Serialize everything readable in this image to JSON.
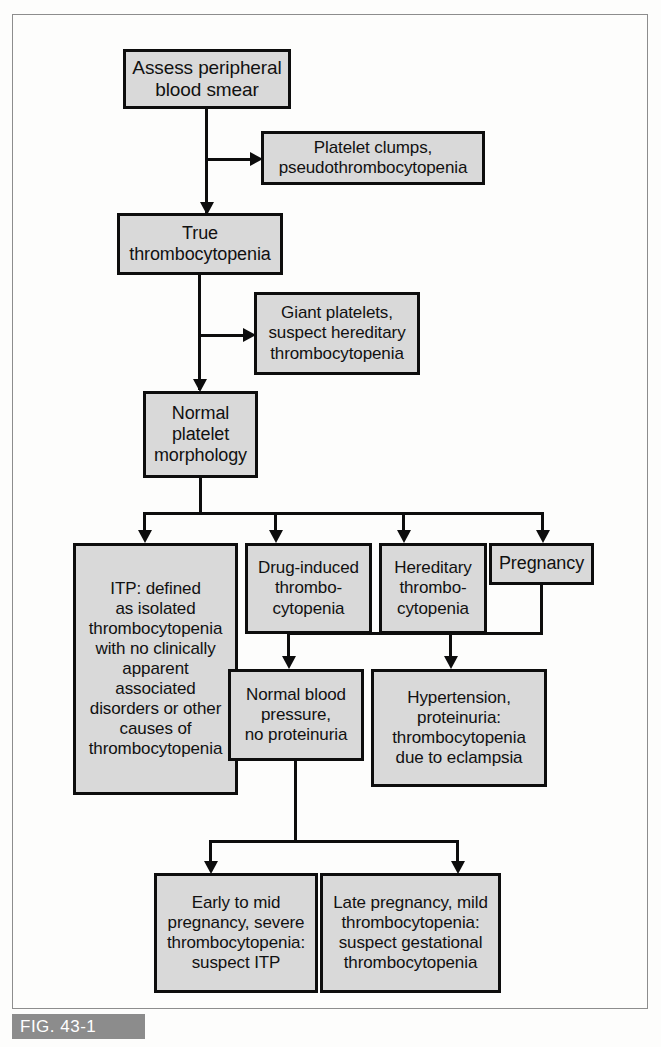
{
  "figure": {
    "caption": "FIG. 43-1",
    "colors": {
      "node_fill": "#d9d9d9",
      "node_border": "#0d0d0d",
      "caption_bar": "#8c8c8c",
      "caption_text": "#ffffff",
      "frame_border": "#8d8d8d",
      "page_background": "#fdfdfc"
    }
  },
  "nodes": {
    "assess": {
      "lines": [
        "Assess peripheral",
        "blood smear"
      ],
      "text": "Assess peripheral blood smear"
    },
    "platelet_clumps": {
      "lines": [
        "Platelet clumps,",
        "pseudothrombocytopenia"
      ],
      "text": "Platelet clumps, pseudothrombocytopenia"
    },
    "true_thrombocytopenia": {
      "lines": [
        "True",
        "thrombocytopenia"
      ],
      "text": "True thrombocytopenia"
    },
    "giant_platelets": {
      "lines": [
        "Giant platelets,",
        "suspect hereditary",
        "thrombocytopenia"
      ],
      "text": "Giant platelets, suspect hereditary thrombocytopenia"
    },
    "normal_morphology": {
      "lines": [
        "Normal",
        "platelet",
        "morphology"
      ],
      "text": "Normal platelet morphology"
    },
    "itp": {
      "lines": [
        "ITP: defined",
        "as isolated",
        "thrombocytopenia",
        "with no clinically",
        "apparent",
        "associated",
        "disorders or other",
        "causes of",
        "thrombocytopenia"
      ],
      "text": "ITP: defined as isolated thrombocytopenia with no clinically apparent associated disorders or other causes of thrombocytopenia"
    },
    "drug_induced": {
      "lines": [
        "Drug-induced",
        "thrombo-",
        "cytopenia"
      ],
      "text": "Drug-induced thrombocytopenia"
    },
    "hereditary": {
      "lines": [
        "Hereditary",
        "thrombo-",
        "cytopenia"
      ],
      "text": "Hereditary thrombocytopenia"
    },
    "pregnancy": {
      "lines": [
        "Pregnancy"
      ],
      "text": "Pregnancy"
    },
    "normal_bp": {
      "lines": [
        "Normal blood",
        "pressure,",
        "no proteinuria"
      ],
      "text": "Normal blood pressure, no proteinuria"
    },
    "hypertension": {
      "lines": [
        "Hypertension,",
        "proteinuria:",
        "thrombocytopenia",
        "due to eclampsia"
      ],
      "text": "Hypertension, proteinuria: thrombocytopenia due to eclampsia"
    },
    "early_mid_pregnancy": {
      "lines": [
        "Early to mid",
        "pregnancy, severe",
        "thrombocytopenia:",
        "suspect ITP"
      ],
      "text": "Early to mid pregnancy, severe thrombocytopenia: suspect ITP"
    },
    "late_pregnancy": {
      "lines": [
        "Late pregnancy, mild",
        "thrombocytopenia:",
        "suspect gestational",
        "thrombocytopenia"
      ],
      "text": "Late pregnancy, mild thrombocytopenia: suspect gestational thrombocytopenia"
    }
  }
}
